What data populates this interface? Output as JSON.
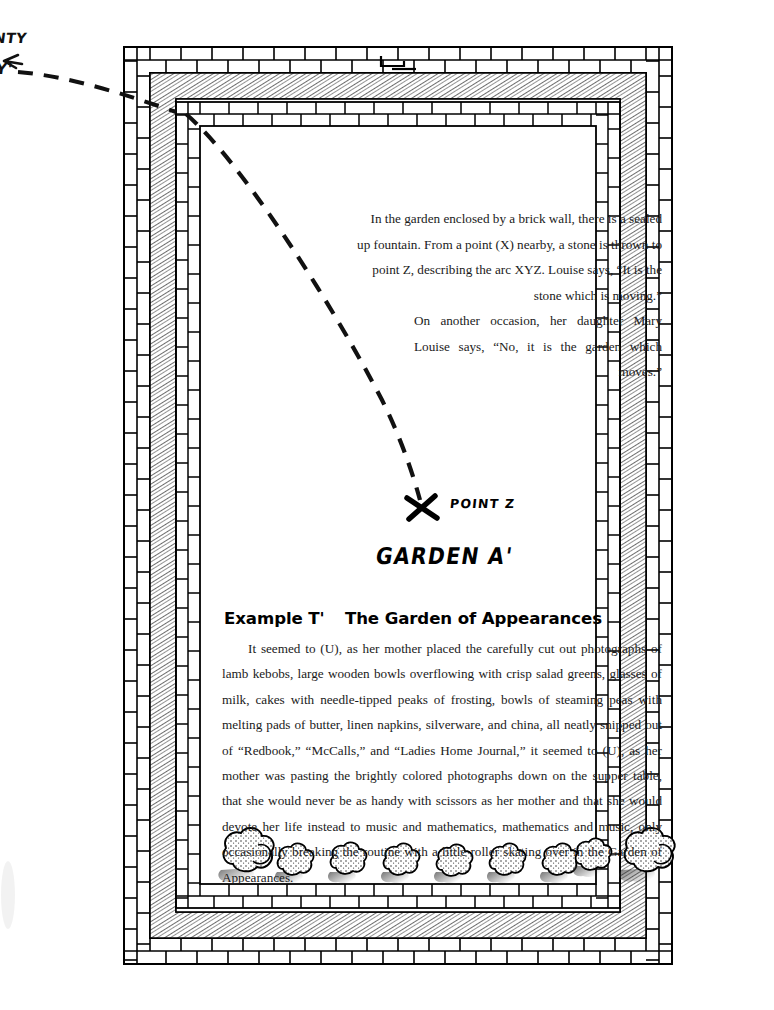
{
  "margin_notes": {
    "top_label": "NTY",
    "arrow_label": "Y'"
  },
  "diagram": {
    "point_z_label": "POINT Z",
    "garden_label": "GARDEN A'",
    "x_mark": "X",
    "arc_description": "dashed parabolic arc XYZ entering at the upper-left wall corner and ending at point Z",
    "shrub_count": 9,
    "wall_layers": [
      "outer brick course",
      "hatched mortar band",
      "inner brick course"
    ],
    "colors": {
      "ink": "#000000",
      "paper": "#ffffff",
      "hatch": "#4a4a4a",
      "text": "#1a1a1a"
    }
  },
  "stone_passage": {
    "paragraph_1": "In the garden enclosed by a brick wall, there is a sealed up fountain. From a point (X) nearby, a stone is thrown to point Z, describing the arc XYZ. Louise says, “It is the stone which is moving.”",
    "paragraph_2": "On another occasion, her daughter Mary Louise says, “No, it is the garden which moves.”"
  },
  "example": {
    "label": "Example T'",
    "title": "The Garden of Appearances",
    "body": "It seemed to (U), as her mother placed the carefully cut out photographs of lamb kebobs, large wooden bowls overflowing with crisp salad greens, glasses of milk, cakes with needle-tipped peaks of frosting, bowls of steaming peas with melting pads of butter, linen napkins, silverware, and china, all neatly snipped out of “Redbook,” “McCalls,” and “Ladies Home Journal,” it seemed to (U), as her mother was pasting the brightly colored photographs down on the supper table, that she would never be as handy with scissors as her mother and that she would devote her life instead to music and mathematics, mathematics and music, only occasionally breaking the routine with a little roller skating over in the Garden of Appearances."
  }
}
